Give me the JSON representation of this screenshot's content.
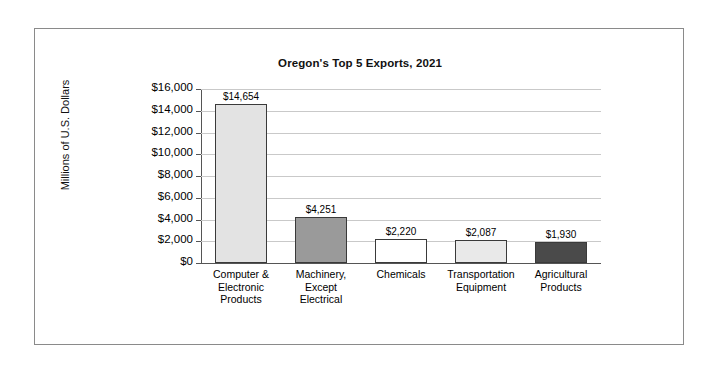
{
  "chart_data": {
    "type": "bar",
    "title": "Oregon's Top 5 Exports, 2021",
    "xlabel": "",
    "ylabel": "Millions of U.S. Dollars",
    "ylim": [
      0,
      16000
    ],
    "ytick_step": 2000,
    "grid": true,
    "legend": "none",
    "categories": [
      "Computer & Electronic Products",
      "Machinery, Except Electrical",
      "Chemicals",
      "Transportation Equipment",
      "Agricultural Products"
    ],
    "category_lines": [
      [
        "Computer &",
        "Electronic",
        "Products"
      ],
      [
        "Machinery,",
        "Except",
        "Electrical"
      ],
      [
        "Chemicals"
      ],
      [
        "Transportation",
        "Equipment"
      ],
      [
        "Agricultural",
        "Products"
      ]
    ],
    "values": [
      14654,
      4251,
      2220,
      2087,
      1930
    ],
    "value_labels": [
      "$14,654",
      "$4,251",
      "$2,220",
      "$2,087",
      "$1,930"
    ],
    "bar_colors": [
      "#e3e3e3",
      "#9a9a9a",
      "#ffffff",
      "#e9e9e9",
      "#4a4a4a"
    ],
    "bar_border_color": "#3a3a3a",
    "ytick_labels": [
      "$16,000",
      "$14,000",
      "$12,000",
      "$10,000",
      "$8,000",
      "$6,000",
      "$4,000",
      "$2,000",
      "$0"
    ],
    "ytick_values": [
      16000,
      14000,
      12000,
      10000,
      8000,
      6000,
      4000,
      2000,
      0
    ]
  }
}
